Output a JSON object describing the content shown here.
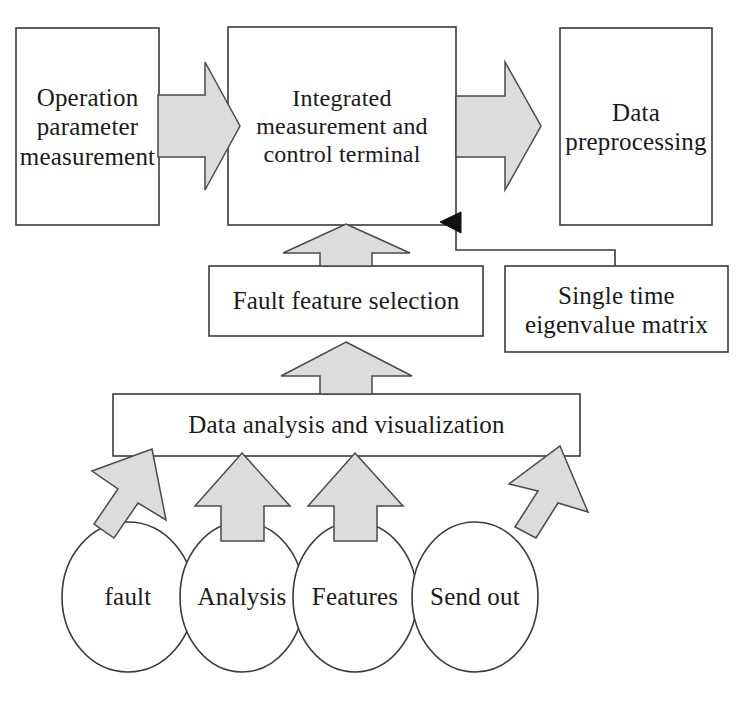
{
  "diagram": {
    "colors": {
      "background": "#ffffff",
      "box_fill": "#ffffff",
      "box_stroke": "#3a3a3a",
      "arrow_fill": "#dcdcdc",
      "arrow_stroke": "#4a4a4a",
      "solid_arrowhead": "#111111",
      "text": "#1a1a1a"
    },
    "nodes": {
      "operation_parameter": {
        "label": "Operation parameter measurement",
        "shape": "rectangle"
      },
      "integrated_terminal": {
        "label": "Integrated measurement and control terminal",
        "shape": "rectangle"
      },
      "data_preprocessing": {
        "label": "Data preprocessing",
        "shape": "rectangle"
      },
      "fault_feature_selection": {
        "label": "Fault feature selection",
        "shape": "rectangle"
      },
      "single_time_eigenvalue": {
        "label": "Single time eigenvalue matrix",
        "shape": "rectangle"
      },
      "data_analysis": {
        "label": "Data analysis and visualization",
        "shape": "rectangle"
      },
      "fault": {
        "label": "fault",
        "shape": "ellipse"
      },
      "analysis": {
        "label": "Analysis",
        "shape": "ellipse"
      },
      "features": {
        "label": "Features",
        "shape": "ellipse"
      },
      "send_out": {
        "label": "Send out",
        "shape": "ellipse"
      }
    },
    "connectors": [
      {
        "id": "op-to-terminal",
        "from": "operation_parameter",
        "to": "integrated_terminal",
        "style": "block-arrow",
        "direction": "right"
      },
      {
        "id": "terminal-to-preprocessing",
        "from": "integrated_terminal",
        "to": "data_preprocessing",
        "style": "block-arrow",
        "direction": "right"
      },
      {
        "id": "eigenvalue-to-terminal",
        "from": "single_time_eigenvalue",
        "to": "integrated_terminal",
        "style": "line-with-solid-arrowhead",
        "direction": "left"
      },
      {
        "id": "fault-feature-to-terminal",
        "from": "fault_feature_selection",
        "to": "integrated_terminal",
        "style": "block-arrow",
        "direction": "up"
      },
      {
        "id": "analysis-to-fault-feature",
        "from": "data_analysis",
        "to": "fault_feature_selection",
        "style": "block-arrow",
        "direction": "up"
      },
      {
        "id": "fault-to-analysis",
        "from": "fault",
        "to": "data_analysis",
        "style": "block-arrow",
        "direction": "up-right-tilted"
      },
      {
        "id": "analysis-node-to-analysis",
        "from": "analysis",
        "to": "data_analysis",
        "style": "block-arrow",
        "direction": "up"
      },
      {
        "id": "features-to-analysis",
        "from": "features",
        "to": "data_analysis",
        "style": "block-arrow",
        "direction": "up"
      },
      {
        "id": "sendout-to-analysis",
        "from": "send_out",
        "to": "data_analysis",
        "style": "block-arrow",
        "direction": "up-left-tilted"
      }
    ]
  }
}
